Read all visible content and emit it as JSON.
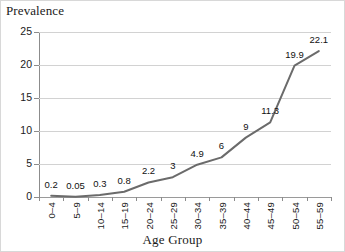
{
  "chart_data": {
    "type": "line",
    "title": "Prevalence",
    "xlabel": "Age Group",
    "ylabel": "Prevalence",
    "categories": [
      "0–4",
      "5–9",
      "10–14",
      "15–19",
      "20–24",
      "25–29",
      "30–34",
      "35–39",
      "40–44",
      "45–49",
      "50–54",
      "55–59"
    ],
    "values": [
      0.2,
      0.05,
      0.3,
      0.8,
      2.2,
      3,
      4.9,
      6,
      9,
      11.3,
      19.9,
      22.1
    ],
    "value_labels": [
      "0.2",
      "0.05",
      "0.3",
      "0.8",
      "2.2",
      "3",
      "4.9",
      "6",
      "9",
      "11.3",
      "19.9",
      "22.1"
    ],
    "ylim": [
      0,
      25
    ],
    "yticks": [
      0,
      5,
      10,
      15,
      20,
      25
    ],
    "ytick_labels": [
      "0",
      "5",
      "10",
      "15",
      "20",
      "25"
    ],
    "grid": true,
    "legend": false,
    "series_color": "#6b6b6b",
    "gridline_color": "#d2d2d2",
    "axis_color": "#8c8c8c"
  }
}
